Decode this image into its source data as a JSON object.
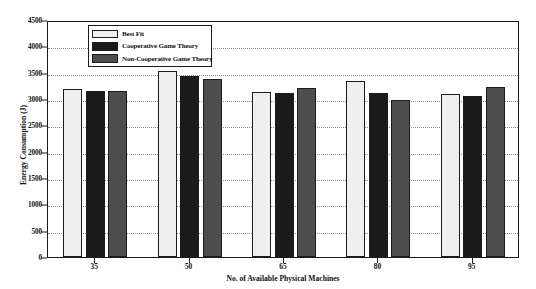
{
  "chart_data": {
    "type": "bar",
    "title": "",
    "xlabel": "No. of Available Physical Machines",
    "ylabel": "Energy Consumption (J)",
    "categories": [
      "35",
      "50",
      "65",
      "80",
      "95"
    ],
    "ylim": [
      0,
      4500
    ],
    "yticks": [
      0,
      500,
      1000,
      1500,
      2000,
      2500,
      3000,
      3500,
      4000,
      4500
    ],
    "grid": true,
    "legend_position": "top-left",
    "series": [
      {
        "name": "Best Fit",
        "color": "#efefef",
        "values": [
          3190,
          3540,
          3130,
          3340,
          3100
        ]
      },
      {
        "name": "Cooperative Game Theory",
        "color": "#1a1a1a",
        "values": [
          3150,
          3440,
          3110,
          3110,
          3050
        ]
      },
      {
        "name": "Non-Cooperative Game Theory",
        "color": "#4d4d4d",
        "values": [
          3150,
          3380,
          3200,
          2990,
          3220
        ]
      }
    ]
  },
  "axes": {
    "ytick_labels": [
      "0",
      "500",
      "1000",
      "1500",
      "2000",
      "2500",
      "3000",
      "3500",
      "4000",
      "4500"
    ],
    "xtick_labels": [
      "35",
      "50",
      "65",
      "80",
      "95"
    ]
  },
  "legend": {
    "items": [
      {
        "label": "Best Fit"
      },
      {
        "label": "Cooperative Game Theory"
      },
      {
        "label": "Non-Cooperative Game Theory"
      }
    ]
  }
}
